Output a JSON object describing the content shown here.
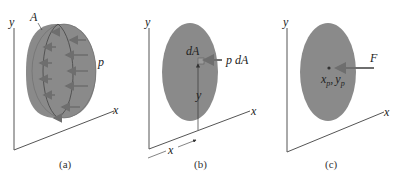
{
  "colors": {
    "fill": "#8a8a8a",
    "fill_dark": "#7a7a7a",
    "stroke": "#555555",
    "axis": "#555555",
    "arrow": "#6e6e6e",
    "background": "#ffffff"
  },
  "panels": [
    {
      "id": "a",
      "caption": "(a)",
      "labels": {
        "y_axis": "y",
        "x_axis": "x",
        "area": "A",
        "pressure": "p"
      }
    },
    {
      "id": "b",
      "caption": "(b)",
      "labels": {
        "y_axis": "y",
        "x_axis": "x",
        "element": "dA",
        "force": "p dA",
        "y_coord": "y",
        "x_coord": "x"
      }
    },
    {
      "id": "c",
      "caption": "(c)",
      "labels": {
        "y_axis": "y",
        "x_axis": "x",
        "force": "F",
        "xp": "x",
        "xp_sub": "p",
        "yp": "y",
        "yp_sub": "p",
        "comma": ","
      }
    }
  ]
}
